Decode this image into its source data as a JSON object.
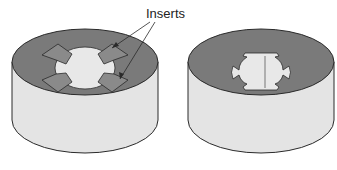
{
  "diagram": {
    "label": "Inserts",
    "colors": {
      "top_face": "#7a7a7a",
      "side_face": "#e4e4e4",
      "hole": "#e8e8e8",
      "insert": "#8a8a8a",
      "outline": "#2a2a2a"
    },
    "figures": [
      {
        "name": "die-with-inserts",
        "description": "Cylindrical die with four inserts around a cross-shaped opening"
      },
      {
        "name": "die-without-inserts",
        "description": "Cylindrical die showing the cross-shaped opening after inserts"
      }
    ]
  }
}
